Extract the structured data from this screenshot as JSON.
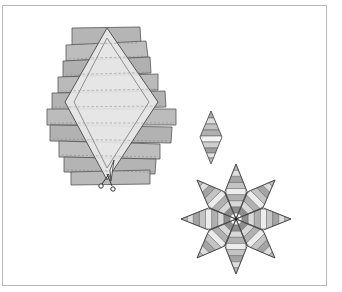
{
  "figure": {
    "title": "",
    "colors": {
      "frame": "#b8b8b8",
      "strip_dark": "#a9a9a9",
      "strip_mid": "#c4c4c4",
      "strip_light": "#dcdcdc",
      "strip_white": "#f4f4f4",
      "outline": "#555555",
      "diamond_fill": "#e9e9e9",
      "seam": "#7a7a7a"
    },
    "panels": [
      {
        "name": "strip-set-with-template",
        "label": ""
      },
      {
        "name": "single-diamond",
        "label": ""
      },
      {
        "name": "eight-point-star",
        "label": ""
      }
    ],
    "icons": [
      "scissors-icon"
    ]
  }
}
